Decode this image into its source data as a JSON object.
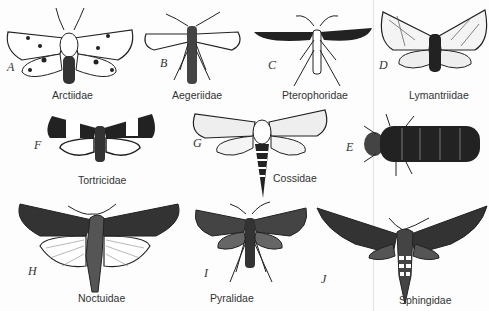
{
  "figure": {
    "type": "illustration-plate",
    "specimens": [
      {
        "letter": "A",
        "family": "Arctiidae"
      },
      {
        "letter": "B",
        "family": "Aegeriidae"
      },
      {
        "letter": "C",
        "family": "Pterophoridae"
      },
      {
        "letter": "D",
        "family": "Lymantriidae"
      },
      {
        "letter": "F",
        "family": "Tortricidae"
      },
      {
        "letter": "G",
        "family": "Cossidae"
      },
      {
        "letter": "E",
        "family": ""
      },
      {
        "letter": "H",
        "family": "Noctuidae"
      },
      {
        "letter": "I",
        "family": "Pyralidae"
      },
      {
        "letter": "J",
        "family": "Sphingidae"
      }
    ]
  },
  "colors": {
    "ink": "#1a1a1a",
    "paper": "#fdfdfd",
    "mid": "#555555"
  }
}
